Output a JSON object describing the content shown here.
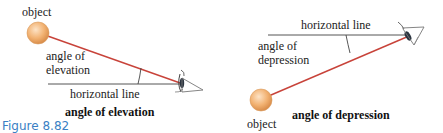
{
  "figure_caption": "Figure 8.82",
  "colors": {
    "sight_line": "#c8433a",
    "horizontal_line": "#555555",
    "object_fill": "#f2b272",
    "caption": "#3a7fc4"
  },
  "panels": [
    {
      "id": "elevation",
      "object_label": "object",
      "angle_label_line1": "angle of",
      "angle_label_line2": "elevation",
      "horizontal_label": "horizontal line",
      "title": "angle of elevation"
    },
    {
      "id": "depression",
      "object_label": "object",
      "angle_label_line1": "angle of",
      "angle_label_line2": "depression",
      "horizontal_label": "horizontal line",
      "title": "angle of depression"
    }
  ]
}
